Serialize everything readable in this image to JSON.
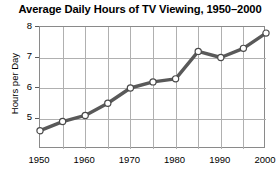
{
  "chart_data": {
    "type": "line",
    "title": "Average Daily Hours of TV Viewing, 1950–2000",
    "xlabel": "",
    "ylabel": "Hours per Day",
    "x": [
      1950,
      1955,
      1960,
      1965,
      1970,
      1975,
      1980,
      1985,
      1990,
      1995,
      2000
    ],
    "values": [
      4.6,
      4.9,
      5.1,
      5.5,
      6.0,
      6.2,
      6.3,
      7.2,
      7.0,
      7.3,
      7.8
    ],
    "categories": [
      "1950",
      "1955",
      "1960",
      "1965",
      "1970",
      "1975",
      "1980",
      "1985",
      "1990",
      "1995",
      "2000"
    ],
    "xlim": [
      1950,
      2000
    ],
    "ylim": [
      4,
      8
    ],
    "xticks": [
      1950,
      1960,
      1970,
      1980,
      1990,
      2000
    ],
    "xtick_labels": [
      "1950",
      "1960",
      "1970",
      "1980",
      "1990",
      "2000"
    ],
    "yticks": [
      5,
      6,
      7,
      8
    ],
    "ytick_labels": [
      "5",
      "6",
      "7",
      "8"
    ],
    "grid": true,
    "gridlines_x_step": 5,
    "gridlines_y_step": 1,
    "legend": null,
    "series_color": "#595959",
    "marker_fill_color": "#ffffff",
    "marker_edge_color": "#4a4a4a",
    "grid_color": "#b0b0b0",
    "axis_color": "#8a8a8a",
    "background_color": "#ffffff"
  }
}
